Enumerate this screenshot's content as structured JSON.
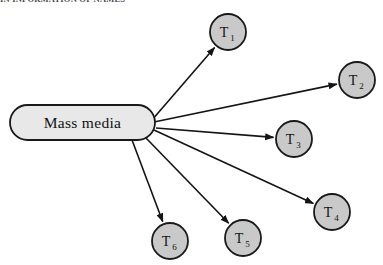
{
  "header": {
    "running_head": "IN INFORMATION OF NAMES"
  },
  "diagram": {
    "type": "radial-hub-and-spoke",
    "hub": {
      "label": "Mass media",
      "shape": "rounded-pill",
      "x": 10,
      "y": 105,
      "width": 145,
      "height": 35,
      "fill": "#e8e8e8",
      "stroke": "#1a1a1a"
    },
    "origin": {
      "x": 152,
      "y": 122
    },
    "node_style": {
      "shape": "circle",
      "radius": 18,
      "fill": "#c9c9c9",
      "stroke": "#1a1a1a"
    },
    "arrow_style": {
      "color": "#141414",
      "width": 1.6,
      "head": "filled-triangle"
    },
    "nodes": [
      {
        "id": "T1",
        "letter": "T",
        "subscript": "1",
        "cx": 228,
        "cy": 32,
        "from_x": 152,
        "from_y": 120
      },
      {
        "id": "T2",
        "letter": "T",
        "subscript": "2",
        "cx": 357,
        "cy": 80,
        "from_x": 154,
        "from_y": 122
      },
      {
        "id": "T3",
        "letter": "T",
        "subscript": "3",
        "cx": 294,
        "cy": 139,
        "from_x": 156,
        "from_y": 128
      },
      {
        "id": "T4",
        "letter": "T",
        "subscript": "4",
        "cx": 332,
        "cy": 212,
        "from_x": 154,
        "from_y": 130
      },
      {
        "id": "T5",
        "letter": "T",
        "subscript": "5",
        "cx": 243,
        "cy": 238,
        "from_x": 146,
        "from_y": 138
      },
      {
        "id": "T6",
        "letter": "T",
        "subscript": "6",
        "cx": 170,
        "cy": 241,
        "from_x": 132,
        "from_y": 140
      }
    ]
  }
}
